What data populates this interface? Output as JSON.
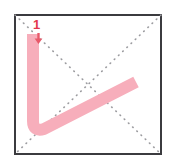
{
  "diagram": {
    "stroke_number_label": "1",
    "stroke_name": "vertical-turn-rising",
    "total_strokes_shown": 1
  },
  "grid": {
    "shape": "square",
    "border_color": "#3b3b3f",
    "border_width_px": 2,
    "background_color": "#ffffff",
    "guide_style": "dotted",
    "guide_color": "#9a9a9e",
    "guides": [
      "diagonal-top-left-to-bottom-right",
      "diagonal-top-right-to-bottom-left"
    ]
  },
  "stroke": {
    "color": "#f7aebb",
    "width_px": 12,
    "label_color": "#e3384d",
    "marker_color": "#e8596a",
    "path": "M 19 20 L 19 107 Q 19 118 30 115 L 122 68",
    "start_point": {
      "x": 19,
      "y": 20
    },
    "end_point": {
      "x": 122,
      "y": 68
    }
  },
  "chart_data": {
    "type": "line",
    "xlabel": "",
    "ylabel": "",
    "series": [
      {
        "name": "stroke-1",
        "x": [
          19,
          19,
          30,
          122
        ],
        "y": [
          20,
          107,
          115,
          68
        ]
      }
    ]
  }
}
